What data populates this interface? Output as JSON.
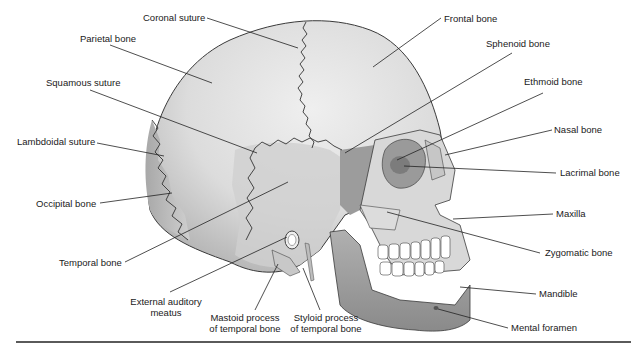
{
  "figure": {
    "labels": {
      "coronal_suture": "Coronal suture",
      "parietal_bone": "Parietal bone",
      "squamous_suture": "Squamous suture",
      "lambdoidal_suture": "Lambdoidal suture",
      "occipital_bone": "Occipital bone",
      "temporal_bone": "Temporal bone",
      "external_auditory_meatus_1": "External auditory",
      "external_auditory_meatus_2": "meatus",
      "mastoid_process_1": "Mastoid process",
      "mastoid_process_2": "of temporal bone",
      "styloid_process_1": "Styloid process",
      "styloid_process_2": "of temporal bone",
      "frontal_bone": "Frontal bone",
      "sphenoid_bone": "Sphenoid bone",
      "ethmoid_bone": "Ethmoid bone",
      "nasal_bone": "Nasal bone",
      "lacrimal_bone": "Lacrimal bone",
      "maxilla": "Maxilla",
      "zygomatic_bone": "Zygomatic bone",
      "mandible": "Mandible",
      "mental_foramen": "Mental foramen"
    },
    "colors": {
      "cranium_light": "#e6e6e6",
      "cranium_mid": "#c4c4c4",
      "cranium_dark": "#9a9a9a",
      "face_light": "#d6d6d6",
      "orbit_dark": "#8c8c8c",
      "teeth": "#ffffff",
      "outline": "#333333",
      "leader_line": "#222222"
    }
  }
}
